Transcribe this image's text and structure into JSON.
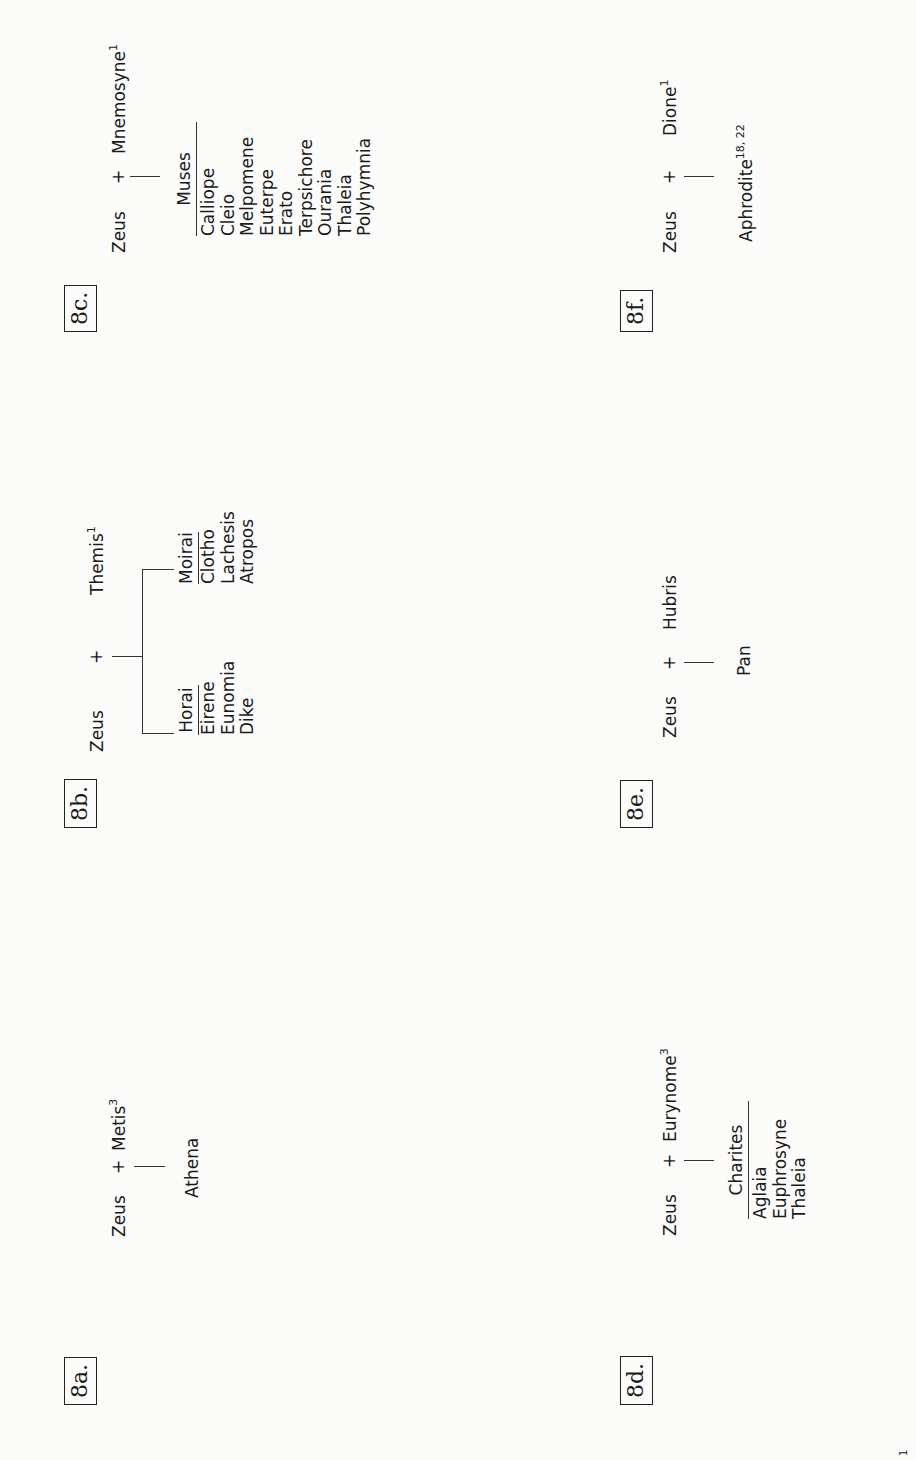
{
  "diagrams": [
    {
      "label": "8a.",
      "father": "Zeus",
      "plus": "+",
      "mother": "Metis",
      "mother_note": "3",
      "children": [
        "Athena"
      ]
    },
    {
      "label": "8b.",
      "father": "Zeus",
      "plus": "+",
      "mother": "Themis",
      "mother_note": "1",
      "groups": [
        {
          "name": "Horai",
          "members": [
            "Eirene",
            "Eunomia",
            "Dike"
          ]
        },
        {
          "name": "Moirai",
          "members": [
            "Clotho",
            "Lachesis",
            "Atropos"
          ]
        }
      ]
    },
    {
      "label": "8c.",
      "father": "Zeus",
      "plus": "+",
      "mother": "Mnemosyne",
      "mother_note": "1",
      "groups": [
        {
          "name": "Muses",
          "members": [
            "Calliope",
            "Cleio",
            "Melpomene",
            "Euterpe",
            "Erato",
            "Terpsichore",
            "Ourania",
            "Thaleia",
            "Polyhymnia"
          ]
        }
      ]
    },
    {
      "label": "8d.",
      "father": "Zeus",
      "plus": "+",
      "mother": "Eurynome",
      "mother_note": "3",
      "groups": [
        {
          "name": "Charites",
          "members": [
            "Aglaia",
            "Euphrosyne",
            "Thaleia"
          ]
        }
      ]
    },
    {
      "label": "8e.",
      "father": "Zeus",
      "plus": "+",
      "mother": "Hubris",
      "mother_note": "",
      "children": [
        "Pan"
      ]
    },
    {
      "label": "8f.",
      "father": "Zeus",
      "plus": "+",
      "mother": "Dione",
      "mother_note": "1",
      "children": [
        "Aphrodite"
      ],
      "child_note": "18, 22"
    }
  ],
  "page_number": "1"
}
